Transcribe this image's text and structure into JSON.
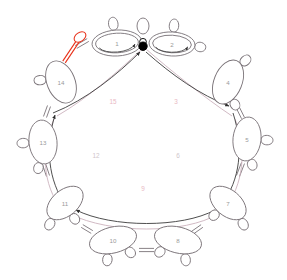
{
  "diagram": {
    "background": "#ffffff",
    "colors": {
      "node_stroke": "#7a7378",
      "node_fill": "#ffffff",
      "node_label": "#9a9a9a",
      "dark_arc": "#3b3b3b",
      "pink_arc": "#c9aeba",
      "pink_label": "#e9b9c4",
      "gray_label": "#cfc6cb",
      "highlight": "#e8331c",
      "vertex_fill": "#000000"
    },
    "vertex": {
      "name": "root-vertex",
      "cx": 143,
      "cy": 45,
      "r": 4.2
    },
    "nodes": [
      {
        "id": "1",
        "label": "1",
        "cx": 117,
        "cy": 43,
        "rx": 25,
        "ry": 13,
        "rot": -3,
        "double": true,
        "loops": [
          {
            "a": -95,
            "len": 13,
            "w": 6
          }
        ]
      },
      {
        "id": "2",
        "label": "2",
        "cx": 172,
        "cy": 44,
        "rx": 23,
        "ry": 12,
        "rot": 3,
        "double": true,
        "loops": [
          {
            "a": -88,
            "len": 13,
            "w": 6
          },
          {
            "a": 5,
            "len": 11,
            "w": 6
          }
        ]
      },
      {
        "id": "4",
        "label": "4",
        "cx": 228,
        "cy": 82,
        "rx": 14,
        "ry": 23,
        "rot": 22,
        "double": false,
        "loops": [
          {
            "a": -66,
            "len": 12,
            "w": 6
          },
          {
            "a": 40,
            "len": 11,
            "w": 6
          }
        ]
      },
      {
        "id": "5",
        "label": "5",
        "cx": 247,
        "cy": 139,
        "rx": 14,
        "ry": 22,
        "rot": 6,
        "double": false,
        "loops": [
          {
            "a": -2,
            "len": 12,
            "w": 6
          },
          {
            "a": 66,
            "len": 11,
            "w": 6
          }
        ]
      },
      {
        "id": "7",
        "label": "7",
        "cx": 228,
        "cy": 203,
        "rx": 21,
        "ry": 13,
        "rot": 40,
        "double": false,
        "loops": [
          {
            "a": 20,
            "len": 12,
            "w": 6
          },
          {
            "a": 96,
            "len": 11,
            "w": 6
          }
        ]
      },
      {
        "id": "8",
        "label": "8",
        "cx": 178,
        "cy": 240,
        "rx": 24,
        "ry": 13,
        "rot": 14,
        "double": false,
        "loops": [
          {
            "a": 66,
            "len": 12,
            "w": 6
          },
          {
            "a": 120,
            "len": 11,
            "w": 6
          }
        ]
      },
      {
        "id": "10",
        "label": "10",
        "cx": 113,
        "cy": 240,
        "rx": 24,
        "ry": 13,
        "rot": -14,
        "double": false,
        "loops": [
          {
            "a": 110,
            "len": 12,
            "w": 6
          },
          {
            "a": 62,
            "len": 11,
            "w": 6
          }
        ]
      },
      {
        "id": "11",
        "label": "11",
        "cx": 65,
        "cy": 203,
        "rx": 21,
        "ry": 13,
        "rot": -40,
        "double": false,
        "loops": [
          {
            "a": 160,
            "len": 12,
            "w": 6
          },
          {
            "a": 96,
            "len": 11,
            "w": 6
          }
        ]
      },
      {
        "id": "13",
        "label": "13",
        "cx": 43,
        "cy": 142,
        "rx": 14,
        "ry": 22,
        "rot": -6,
        "double": false,
        "loops": [
          {
            "a": 182,
            "len": 12,
            "w": 6
          },
          {
            "a": 112,
            "len": 11,
            "w": 6
          }
        ]
      },
      {
        "id": "14",
        "label": "14",
        "cx": 61,
        "cy": 82,
        "rx": 14,
        "ry": 22,
        "rot": -22,
        "double": false,
        "loops": [
          {
            "a": 200,
            "len": 12,
            "w": 6
          }
        ]
      }
    ],
    "extra_loops": [
      {
        "name": "loop-top-center",
        "cx": 143,
        "cy": 26,
        "rx": 6,
        "ry": 8,
        "rot": 0
      }
    ],
    "highlight_edge": {
      "name": "highlighted-red-loop",
      "from_x": 64,
      "from_y": 62,
      "to_x": 78,
      "to_y": 41,
      "loop_cx": 80,
      "loop_cy": 37,
      "color": "#e8331c"
    },
    "chords": [
      {
        "id": "15",
        "label": "15",
        "label_x": 113,
        "label_y": 101,
        "kind": "pink",
        "path": "M 143 48 C 120 70 88 98 57 116",
        "arrow": true,
        "arrow_dir": "in"
      },
      {
        "id": "3",
        "label": "3",
        "label_x": 176,
        "label_y": 101,
        "kind": "pink",
        "path": "M 146 49 C 170 70 205 98 232 116",
        "arrow": true,
        "arrow_dir": "out"
      },
      {
        "id": "6",
        "label": "6",
        "label_x": 178,
        "label_y": 155,
        "kind": "pink",
        "path": "M 235 119 C 247 150 244 184 224 210",
        "arrow": true,
        "arrow_dir": "out"
      },
      {
        "id": "9",
        "label": "9",
        "label_x": 143,
        "label_y": 188,
        "kind": "pink",
        "path": "M 218 214 C 185 234 110 234 70 214",
        "arrow": true,
        "arrow_dir": "out"
      },
      {
        "id": "12",
        "label": "12",
        "label_x": 96,
        "label_y": 155,
        "kind": "pink",
        "path": "M 62 210 C 42 184 41 150 54 119",
        "arrow": true,
        "arrow_dir": "out"
      }
    ],
    "dark_arcs": [
      {
        "name": "dark-arc-15",
        "path": "M 53 113 C 86 100 118 74 140 52"
      },
      {
        "name": "dark-arc-3",
        "path": "M 146 52 C 172 75 200 95 229 106"
      },
      {
        "name": "dark-arc-6",
        "path": "M 233 113 C 244 147 240 180 222 204"
      },
      {
        "name": "dark-arc-9",
        "path": "M 215 210 C 182 228 112 228 76 210"
      },
      {
        "name": "dark-arc-12",
        "path": "M 66 206 C 48 180 45 147 55 115"
      }
    ],
    "rim_links": [
      {
        "name": "rim-link-1-14",
        "x1": 88,
        "y1": 40,
        "x2": 76,
        "y2": 47
      },
      {
        "name": "rim-link-4-5",
        "x1": 238,
        "y1": 108,
        "x2": 243,
        "y2": 118
      },
      {
        "name": "rim-link-5-7",
        "x1": 243,
        "y1": 163,
        "x2": 238,
        "y2": 176
      },
      {
        "name": "rim-link-7-8",
        "x1": 202,
        "y1": 226,
        "x2": 192,
        "y2": 233
      },
      {
        "name": "rim-link-8-10",
        "x1": 154,
        "y1": 250,
        "x2": 139,
        "y2": 250
      },
      {
        "name": "rim-link-10-11",
        "x1": 92,
        "y1": 232,
        "x2": 82,
        "y2": 226
      },
      {
        "name": "rim-link-11-13",
        "x1": 48,
        "y1": 176,
        "x2": 44,
        "y2": 164
      },
      {
        "name": "rim-link-13-14",
        "x1": 45,
        "y1": 117,
        "x2": 49,
        "y2": 106
      }
    ]
  }
}
